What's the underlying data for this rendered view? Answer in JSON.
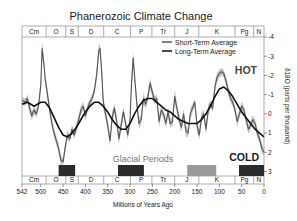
{
  "chart_data": {
    "type": "line",
    "title": "Phanerozoic Climate Change",
    "xlabel": "Millions of Years Ago",
    "ylabel": "δ18O (parts per thousand)",
    "xlim": [
      542,
      0
    ],
    "ylim": [
      -4,
      3
    ],
    "y_inverted": true,
    "x_ticks": [
      542,
      500,
      450,
      400,
      350,
      300,
      250,
      200,
      150,
      100,
      50,
      0
    ],
    "y_ticks": [
      -4,
      -3,
      -2,
      -1,
      0,
      1,
      2,
      3
    ],
    "grid": false,
    "legend_position": "upper right",
    "legend": [
      "Short-Term Average",
      "Long-Term Average"
    ],
    "annotations": [
      {
        "text": "HOT",
        "ma": 30,
        "value": -1.8
      },
      {
        "text": "COLD",
        "ma": 30,
        "value": 1.9
      },
      {
        "text": "Glacial Periods",
        "ma": 270,
        "value": 2.3
      }
    ],
    "periods": [
      {
        "label": "Cm",
        "start": 542,
        "end": 488
      },
      {
        "label": "O",
        "start": 488,
        "end": 444
      },
      {
        "label": "S",
        "start": 444,
        "end": 416
      },
      {
        "label": "D",
        "start": 416,
        "end": 359
      },
      {
        "label": "C",
        "start": 359,
        "end": 299
      },
      {
        "label": "P",
        "start": 299,
        "end": 251
      },
      {
        "label": "Tr",
        "start": 251,
        "end": 200
      },
      {
        "label": "J",
        "start": 200,
        "end": 146
      },
      {
        "label": "K",
        "start": 146,
        "end": 65
      },
      {
        "label": "Pg",
        "start": 65,
        "end": 23
      },
      {
        "label": "N",
        "start": 23,
        "end": 0
      }
    ],
    "glacial_periods": [
      {
        "start": 460,
        "end": 423,
        "color": "#2b2b2b"
      },
      {
        "start": 327,
        "end": 269,
        "color": "#2b2b2b"
      },
      {
        "start": 172,
        "end": 107,
        "color": "#9a9a9a"
      },
      {
        "start": 56,
        "end": 0,
        "color": "#2b2b2b"
      }
    ],
    "series": [
      {
        "name": "Short-Term Average",
        "color": "#555555",
        "x": [
          542,
          535,
          530,
          525,
          520,
          515,
          510,
          505,
          500,
          497,
          493,
          490,
          485,
          480,
          475,
          470,
          465,
          460,
          455,
          450,
          445,
          440,
          435,
          430,
          425,
          420,
          415,
          410,
          405,
          400,
          395,
          390,
          385,
          380,
          375,
          370,
          367,
          363,
          360,
          355,
          350,
          345,
          340,
          335,
          330,
          325,
          320,
          315,
          310,
          305,
          300,
          297,
          293,
          290,
          285,
          280,
          275,
          270,
          265,
          260,
          255,
          250,
          245,
          240,
          235,
          230,
          225,
          220,
          215,
          210,
          205,
          200,
          195,
          190,
          185,
          180,
          175,
          170,
          165,
          160,
          155,
          150,
          145,
          140,
          135,
          130,
          125,
          120,
          115,
          110,
          105,
          100,
          95,
          90,
          85,
          80,
          75,
          70,
          65,
          60,
          55,
          50,
          45,
          40,
          35,
          30,
          25,
          20,
          15,
          10,
          5,
          0
        ],
        "values": [
          -0.7,
          -0.6,
          -0.8,
          -0.3,
          0.1,
          -0.2,
          0.0,
          -0.4,
          -1.5,
          -3.4,
          -2.6,
          -1.8,
          -1.0,
          -0.2,
          0.5,
          1.0,
          1.4,
          1.8,
          2.4,
          2.5,
          1.7,
          1.1,
          1.3,
          0.8,
          1.1,
          0.7,
          0.3,
          -0.2,
          -0.4,
          0.1,
          -0.3,
          -0.6,
          -0.8,
          -1.2,
          -2.0,
          -3.3,
          -3.4,
          -2.0,
          -0.6,
          0.0,
          0.6,
          1.4,
          0.2,
          -0.3,
          0.4,
          1.3,
          0.6,
          -0.1,
          0.5,
          1.1,
          0.3,
          -1.5,
          -2.9,
          -2.0,
          -0.6,
          0.5,
          0.3,
          -0.8,
          -0.5,
          -0.9,
          -1.6,
          -1.1,
          -0.7,
          -0.8,
          0.4,
          -0.2,
          0.0,
          0.5,
          -0.1,
          0.5,
          0.4,
          -0.9,
          -0.3,
          0.3,
          0.7,
          0.0,
          0.9,
          1.0,
          0.0,
          -0.3,
          -0.6,
          0.6,
          1.1,
          0.2,
          0.0,
          0.8,
          -0.2,
          -0.5,
          -0.3,
          -1.4,
          -1.9,
          -2.1,
          -2.2,
          -2.1,
          -1.7,
          -1.2,
          -0.8,
          -0.6,
          -0.2,
          0.4,
          0.0,
          -0.4,
          -0.2,
          0.3,
          0.8,
          0.6,
          0.3,
          0.5,
          1.0,
          1.3,
          1.8,
          2.0
        ]
      },
      {
        "name": "Long-Term Average",
        "color": "#111111",
        "x": [
          542,
          530,
          515,
          500,
          490,
          480,
          470,
          460,
          450,
          440,
          430,
          420,
          410,
          400,
          390,
          380,
          370,
          360,
          350,
          340,
          330,
          320,
          310,
          300,
          290,
          280,
          270,
          260,
          250,
          240,
          230,
          220,
          210,
          200,
          190,
          180,
          170,
          160,
          150,
          140,
          130,
          120,
          110,
          100,
          90,
          80,
          70,
          60,
          50,
          40,
          30,
          20,
          10,
          0
        ],
        "values": [
          -0.5,
          -0.6,
          -0.4,
          -0.6,
          -0.6,
          -0.3,
          0.2,
          0.7,
          1.1,
          1.2,
          1.0,
          0.7,
          0.3,
          -0.1,
          -0.4,
          -0.6,
          -0.6,
          -0.4,
          -0.1,
          0.3,
          0.6,
          0.8,
          0.8,
          0.5,
          0.0,
          -0.4,
          -0.7,
          -0.8,
          -0.8,
          -0.6,
          -0.4,
          -0.2,
          -0.1,
          0.1,
          0.3,
          0.4,
          0.5,
          0.5,
          0.5,
          0.3,
          0.0,
          -0.4,
          -0.9,
          -1.3,
          -1.4,
          -1.2,
          -0.9,
          -0.5,
          -0.1,
          0.2,
          0.5,
          0.8,
          1.0,
          1.2
        ]
      }
    ]
  }
}
